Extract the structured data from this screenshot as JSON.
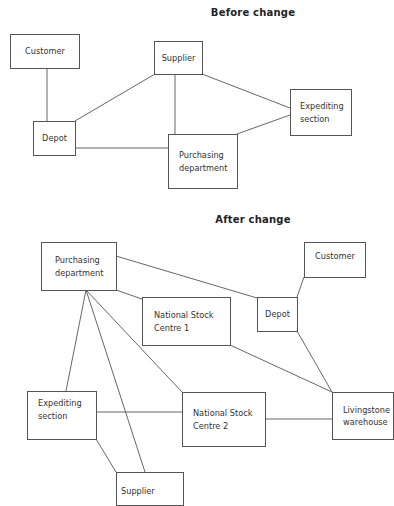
{
  "diagrams": [
    {
      "title": "Before change",
      "nodes": {
        "customer": "Customer",
        "supplier": "Supplier",
        "expediting": "Expediting\nsection",
        "depot": "Depot",
        "purchasing": "Purchasing\ndepartment"
      },
      "links": [
        [
          "Customer",
          "Depot"
        ],
        [
          "Supplier",
          "Depot"
        ],
        [
          "Supplier",
          "Purchasing department"
        ],
        [
          "Supplier",
          "Expediting section"
        ],
        [
          "Expediting section",
          "Purchasing department"
        ],
        [
          "Depot",
          "Purchasing department"
        ]
      ]
    },
    {
      "title": "After change",
      "nodes": {
        "purchasing": "Purchasing\ndepartment",
        "customer": "Customer",
        "nsc1": "National Stock\nCentre 1",
        "depot": "Depot",
        "expediting": "Expediting\nsection",
        "nsc2": "National Stock\nCentre 2",
        "livingstone": "Livingstone\nwarehouse",
        "supplier": "Supplier"
      },
      "links": [
        [
          "Purchasing department",
          "Depot"
        ],
        [
          "Purchasing department",
          "National Stock Centre 1"
        ],
        [
          "Purchasing department",
          "Expediting section"
        ],
        [
          "Purchasing department",
          "Supplier"
        ],
        [
          "Purchasing department",
          "National Stock Centre 2"
        ],
        [
          "Customer",
          "Depot"
        ],
        [
          "National Stock Centre 1",
          "Livingstone warehouse"
        ],
        [
          "Depot",
          "Livingstone warehouse"
        ],
        [
          "Expediting section",
          "National Stock Centre 2"
        ],
        [
          "National Stock Centre 2",
          "Livingstone warehouse"
        ],
        [
          "Expediting section",
          "Supplier"
        ]
      ]
    }
  ],
  "colors": {
    "line": "#555555",
    "text": "#333333",
    "background": "#ffffff"
  }
}
